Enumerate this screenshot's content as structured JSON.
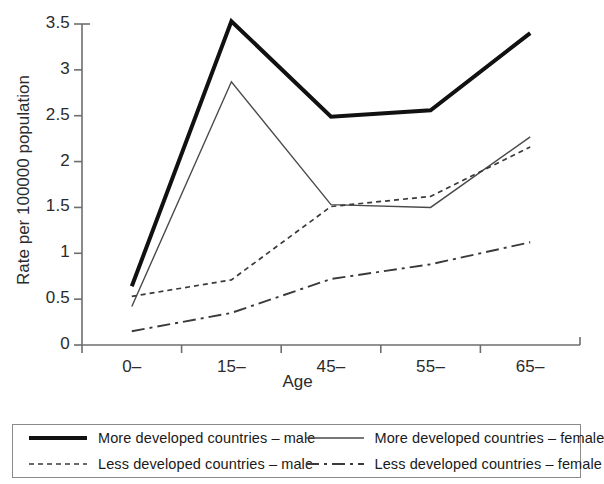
{
  "chart_data": {
    "type": "line",
    "title": "",
    "xlabel": "Age",
    "ylabel": "Rate per 100000 population",
    "categories": [
      "0–",
      "15–",
      "45–",
      "55–",
      "65–"
    ],
    "ylim": [
      0,
      3.5
    ],
    "yticks": [
      0,
      0.5,
      1,
      1.5,
      2,
      2.5,
      3,
      3.5
    ],
    "ytick_labels": [
      "0",
      "0.5",
      "1",
      "1.5",
      "2",
      "2.5",
      "3",
      "3.5"
    ],
    "grid": false,
    "legend_position": "bottom",
    "series": [
      {
        "name": "More developed countries – male",
        "values": [
          0.64,
          3.53,
          2.49,
          2.56,
          3.4
        ],
        "style": "solid",
        "width": 4,
        "color": "#111111"
      },
      {
        "name": "More developed countries – female",
        "values": [
          0.42,
          2.87,
          1.53,
          1.5,
          2.27
        ],
        "style": "solid",
        "width": 1.4,
        "color": "#4a4a4a"
      },
      {
        "name": "Less developed countries – male",
        "values": [
          0.53,
          0.71,
          1.51,
          1.62,
          2.16
        ],
        "style": "dotted",
        "width": 1.7,
        "color": "#3a3a3a"
      },
      {
        "name": "Less developed countries – female",
        "values": [
          0.15,
          0.35,
          0.72,
          0.88,
          1.12
        ],
        "style": "dashdot",
        "width": 1.9,
        "color": "#3a3a3a"
      }
    ]
  },
  "axes": {
    "x_title": "Age",
    "y_title": "Rate per 100000 population"
  },
  "legend": {
    "rows": [
      [
        {
          "label": "More developed countries – male",
          "swatch": "solid-thick-line-swatch"
        },
        {
          "label": "More developed countries – female",
          "swatch": "solid-thin-line-swatch"
        }
      ],
      [
        {
          "label": "Less developed countries – male",
          "swatch": "dotted-line-swatch"
        },
        {
          "label": "Less developed countries – female",
          "swatch": "dashdot-line-swatch"
        }
      ]
    ]
  }
}
